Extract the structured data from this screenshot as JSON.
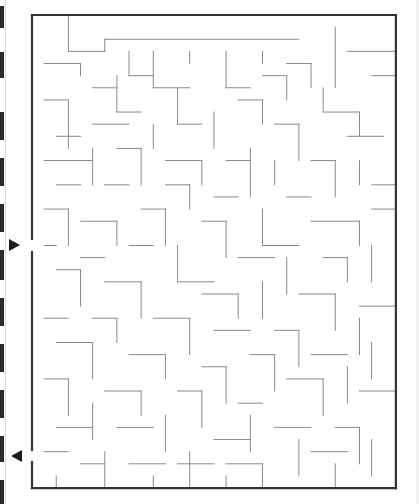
{
  "maze": {
    "origin": [
      32,
      15
    ],
    "cell": 12.13,
    "cols": 30,
    "rows": 39,
    "border_color": "#333333",
    "wall_color": "#8a8a8a",
    "border_width": 2.2,
    "wall_width": 1,
    "openings": [
      {
        "side": "left",
        "from_px": 239,
        "to_px": 252,
        "label": "entrance"
      },
      {
        "side": "left",
        "from_px": 450,
        "to_px": 462,
        "label": "exit"
      }
    ],
    "walls": [
      [
        3,
        0,
        3,
        3
      ],
      [
        3,
        3,
        6,
        3
      ],
      [
        6,
        2,
        6,
        3
      ],
      [
        6,
        2,
        22,
        2
      ],
      [
        25,
        1,
        25,
        3
      ],
      [
        25,
        3,
        25,
        6
      ],
      [
        26,
        3,
        30,
        3
      ],
      [
        1,
        4,
        4,
        4
      ],
      [
        4,
        4,
        4,
        5
      ],
      [
        8,
        3,
        8,
        5
      ],
      [
        10,
        3,
        10,
        6
      ],
      [
        10,
        6,
        13,
        6
      ],
      [
        13,
        3,
        13,
        4
      ],
      [
        16,
        3,
        16,
        6
      ],
      [
        16,
        6,
        18,
        6
      ],
      [
        19,
        3,
        19,
        4
      ],
      [
        21,
        4,
        23,
        4
      ],
      [
        23,
        4,
        23,
        6
      ],
      [
        28,
        5,
        30,
        5
      ],
      [
        19,
        5,
        21,
        5
      ],
      [
        21,
        5,
        21,
        7
      ],
      [
        8,
        5,
        10,
        5
      ],
      [
        5,
        6,
        7,
        6
      ],
      [
        7,
        5,
        7,
        8
      ],
      [
        7,
        8,
        9,
        8
      ],
      [
        12,
        6,
        12,
        9
      ],
      [
        12,
        9,
        14,
        9
      ],
      [
        17,
        7,
        19,
        7
      ],
      [
        19,
        7,
        19,
        9
      ],
      [
        24,
        6,
        24,
        8
      ],
      [
        24,
        8,
        27,
        8
      ],
      [
        27,
        8,
        27,
        10
      ],
      [
        1,
        7,
        3,
        7
      ],
      [
        3,
        7,
        3,
        11
      ],
      [
        2,
        10,
        4,
        10
      ],
      [
        5,
        9,
        8,
        9
      ],
      [
        10,
        9,
        10,
        11
      ],
      [
        15,
        8,
        15,
        11
      ],
      [
        20,
        9,
        22,
        9
      ],
      [
        22,
        9,
        22,
        12
      ],
      [
        26,
        10,
        29,
        10
      ],
      [
        1,
        12,
        5,
        12
      ],
      [
        5,
        11,
        5,
        14
      ],
      [
        7,
        11,
        9,
        11
      ],
      [
        9,
        11,
        9,
        14
      ],
      [
        11,
        12,
        14,
        12
      ],
      [
        14,
        12,
        14,
        14
      ],
      [
        16,
        12,
        18,
        12
      ],
      [
        18,
        11,
        18,
        15
      ],
      [
        20,
        12,
        20,
        14
      ],
      [
        23,
        12,
        25,
        12
      ],
      [
        25,
        12,
        25,
        15
      ],
      [
        27,
        12,
        27,
        14
      ],
      [
        28,
        14,
        30,
        14
      ],
      [
        2,
        14,
        4,
        14
      ],
      [
        6,
        14,
        8,
        14
      ],
      [
        11,
        14,
        13,
        14
      ],
      [
        13,
        14,
        13,
        16
      ],
      [
        15,
        15,
        17,
        15
      ],
      [
        21,
        15,
        23,
        15
      ],
      [
        1,
        16,
        3,
        16
      ],
      [
        3,
        16,
        3,
        19
      ],
      [
        4,
        17,
        7,
        17
      ],
      [
        7,
        17,
        7,
        19
      ],
      [
        9,
        16,
        11,
        16
      ],
      [
        11,
        16,
        11,
        19
      ],
      [
        14,
        17,
        16,
        17
      ],
      [
        16,
        17,
        16,
        20
      ],
      [
        19,
        16,
        19,
        19
      ],
      [
        19,
        19,
        22,
        19
      ],
      [
        23,
        17,
        27,
        17
      ],
      [
        27,
        17,
        27,
        19
      ],
      [
        28,
        16,
        30,
        16
      ],
      [
        1,
        19,
        2,
        19
      ],
      [
        4,
        20,
        6,
        20
      ],
      [
        8,
        19,
        10,
        19
      ],
      [
        12,
        19,
        12,
        22
      ],
      [
        12,
        22,
        15,
        22
      ],
      [
        17,
        20,
        20,
        20
      ],
      [
        21,
        20,
        21,
        23
      ],
      [
        24,
        20,
        26,
        20
      ],
      [
        26,
        20,
        26,
        22
      ],
      [
        28,
        19,
        28,
        22
      ],
      [
        2,
        21,
        4,
        21
      ],
      [
        4,
        21,
        4,
        24
      ],
      [
        6,
        22,
        9,
        22
      ],
      [
        9,
        22,
        9,
        25
      ],
      [
        14,
        23,
        17,
        23
      ],
      [
        17,
        23,
        17,
        25
      ],
      [
        19,
        22,
        19,
        25
      ],
      [
        22,
        23,
        25,
        23
      ],
      [
        25,
        23,
        25,
        26
      ],
      [
        27,
        24,
        30,
        24
      ],
      [
        1,
        25,
        3,
        25
      ],
      [
        5,
        25,
        7,
        25
      ],
      [
        7,
        25,
        7,
        27
      ],
      [
        10,
        25,
        13,
        25
      ],
      [
        13,
        25,
        13,
        28
      ],
      [
        15,
        26,
        18,
        26
      ],
      [
        20,
        26,
        22,
        26
      ],
      [
        22,
        26,
        22,
        29
      ],
      [
        27,
        25,
        27,
        28
      ],
      [
        2,
        27,
        5,
        27
      ],
      [
        5,
        27,
        5,
        30
      ],
      [
        8,
        28,
        11,
        28
      ],
      [
        11,
        28,
        11,
        30
      ],
      [
        14,
        29,
        16,
        29
      ],
      [
        16,
        29,
        16,
        32
      ],
      [
        18,
        28,
        20,
        28
      ],
      [
        20,
        28,
        20,
        31
      ],
      [
        23,
        28,
        26,
        28
      ],
      [
        26,
        29,
        26,
        32
      ],
      [
        28,
        27,
        28,
        30
      ],
      [
        1,
        30,
        3,
        30
      ],
      [
        3,
        30,
        3,
        33
      ],
      [
        6,
        31,
        9,
        31
      ],
      [
        9,
        31,
        9,
        33
      ],
      [
        12,
        31,
        14,
        31
      ],
      [
        14,
        31,
        14,
        34
      ],
      [
        17,
        32,
        19,
        32
      ],
      [
        21,
        30,
        24,
        30
      ],
      [
        24,
        30,
        24,
        33
      ],
      [
        27,
        31,
        30,
        31
      ],
      [
        2,
        34,
        5,
        34
      ],
      [
        5,
        32,
        5,
        35
      ],
      [
        7,
        34,
        10,
        34
      ],
      [
        11,
        33,
        11,
        36
      ],
      [
        15,
        35,
        18,
        35
      ],
      [
        18,
        33,
        18,
        36
      ],
      [
        20,
        34,
        23,
        34
      ],
      [
        22,
        35,
        22,
        38
      ],
      [
        25,
        34,
        27,
        34
      ],
      [
        27,
        34,
        27,
        37
      ],
      [
        1,
        36,
        3,
        36
      ],
      [
        4,
        37,
        6,
        37
      ],
      [
        6,
        36,
        6,
        39
      ],
      [
        8,
        37,
        11,
        37
      ],
      [
        12,
        37,
        15,
        37
      ],
      [
        13,
        36,
        13,
        39
      ],
      [
        16,
        37,
        19,
        37
      ],
      [
        19,
        37,
        19,
        39
      ],
      [
        23,
        36,
        26,
        36
      ],
      [
        25,
        37,
        25,
        39
      ],
      [
        28,
        35,
        28,
        38
      ],
      [
        2,
        38,
        2,
        39
      ],
      [
        10,
        38,
        10,
        39
      ],
      [
        16,
        38,
        16,
        39
      ]
    ]
  },
  "arrows": [
    {
      "name": "entrance-arrow",
      "direction": "right",
      "x": 9,
      "y": 239
    },
    {
      "name": "exit-arrow",
      "direction": "left",
      "x": 11,
      "y": 450
    }
  ],
  "binding": {
    "marks": [
      [
        6,
        28
      ],
      [
        52,
        78
      ],
      [
        112,
        140
      ],
      [
        158,
        186
      ],
      [
        204,
        232
      ],
      [
        250,
        280
      ],
      [
        298,
        326
      ],
      [
        344,
        372
      ],
      [
        390,
        418
      ],
      [
        436,
        462
      ],
      [
        480,
        504
      ]
    ]
  }
}
